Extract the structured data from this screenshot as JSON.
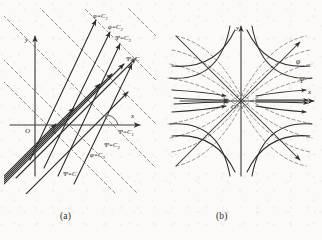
{
  "figure": {
    "type": "diagram",
    "panels": [
      {
        "id": "a",
        "caption": "(a)",
        "axes": {
          "x_label": "x",
          "y_label": "y",
          "origin_label": "O"
        },
        "angle_label": "α",
        "solid_family_name": "φ",
        "dashed_family_name": "Ψ",
        "labels": [
          {
            "text": "φ=C",
            "sub": "1",
            "x": 93,
            "y": 13,
            "family": "phi"
          },
          {
            "text": "φ=C",
            "sub": "2",
            "x": 108,
            "y": 24,
            "family": "phi"
          },
          {
            "text": "Ψ=C",
            "sub": "3",
            "x": 115,
            "y": 35,
            "family": "psi"
          },
          {
            "text": "Ψ=C",
            "sub": "",
            "x": 126,
            "y": 56,
            "family": "psi"
          },
          {
            "text": "Ψ=C",
            "sub": "1",
            "x": 118,
            "y": 129,
            "family": "psi"
          },
          {
            "text": "Ψ=C",
            "sub": "2",
            "x": 104,
            "y": 142,
            "family": "psi"
          },
          {
            "text": "φ=C",
            "sub": "3",
            "x": 90,
            "y": 152,
            "family": "phi"
          },
          {
            "text": "Ψ=C",
            "sub": "",
            "x": 63,
            "y": 171,
            "family": "psi"
          }
        ]
      },
      {
        "id": "b",
        "caption": "(b)",
        "axes": {
          "x_label": "x",
          "y_label": "y",
          "origin_label": "O"
        },
        "labels": [
          {
            "text": "φ",
            "x": 296,
            "y": 60
          },
          {
            "text": "Ψ",
            "x": 299,
            "y": 79
          }
        ],
        "solid_family_name": "Ψ",
        "dashed_family_name": "φ"
      }
    ],
    "colors": {
      "ink": "#1d1d1d",
      "line": "#3a3a3a",
      "dashed": "#6e6e6e",
      "axis": "#4a4a4a",
      "paper": "#fbfaf8"
    }
  }
}
